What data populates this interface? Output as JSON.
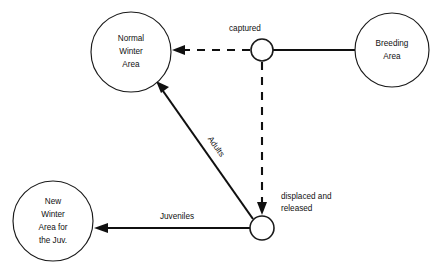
{
  "diagram": {
    "background_color": "#ffffff",
    "stroke_color": "#101010",
    "nodes": [
      {
        "id": "normal-winter-area",
        "kind": "large-circle",
        "cx": 131,
        "cy": 52,
        "r": 40,
        "lines": [
          "Normal",
          "Winter",
          "Area"
        ],
        "line1": "Normal",
        "line2": "Winter",
        "line3": "Area"
      },
      {
        "id": "breeding-area",
        "kind": "large-circle",
        "cx": 392,
        "cy": 50,
        "r": 37,
        "lines": [
          "Breeding",
          "Area"
        ],
        "line1": "Breeding",
        "line2": "Area"
      },
      {
        "id": "new-winter-area-juv",
        "kind": "large-circle",
        "cx": 53,
        "cy": 221,
        "r": 40,
        "lines": [
          "New",
          "Winter",
          "Area for",
          "the Juv."
        ],
        "line1": "New",
        "line2": "Winter",
        "line3": "Area for",
        "line4": "the Juv."
      },
      {
        "id": "captured-node",
        "kind": "small-circle",
        "cx": 262,
        "cy": 50,
        "r": 11,
        "label": "captured"
      },
      {
        "id": "displaced-node",
        "kind": "small-circle",
        "cx": 262,
        "cy": 228,
        "r": 12,
        "label_line1": "displaced and",
        "label_line2": "released"
      }
    ],
    "edges": [
      {
        "id": "breeding-to-captured",
        "from": "breeding-area",
        "to": "captured-node",
        "style": "solid",
        "arrow": false,
        "label": ""
      },
      {
        "id": "captured-to-normal-winter",
        "from": "captured-node",
        "to": "normal-winter-area",
        "style": "dashed",
        "arrow": true,
        "label": ""
      },
      {
        "id": "captured-to-displaced",
        "from": "captured-node",
        "to": "displaced-node",
        "style": "dashed",
        "arrow": true,
        "label": ""
      },
      {
        "id": "displaced-to-normal-winter",
        "from": "displaced-node",
        "to": "normal-winter-area",
        "style": "solid",
        "arrow": true,
        "label": "Adults",
        "label_rotation": 55
      },
      {
        "id": "displaced-to-new-winter",
        "from": "displaced-node",
        "to": "new-winter-area-juv",
        "style": "solid",
        "arrow": true,
        "label": "Juveniles",
        "label_rotation": 0
      }
    ],
    "labels": {
      "captured": "captured",
      "displaced_line1": "displaced and",
      "displaced_line2": "released",
      "adults": "Adults",
      "juveniles": "Juveniles"
    }
  }
}
